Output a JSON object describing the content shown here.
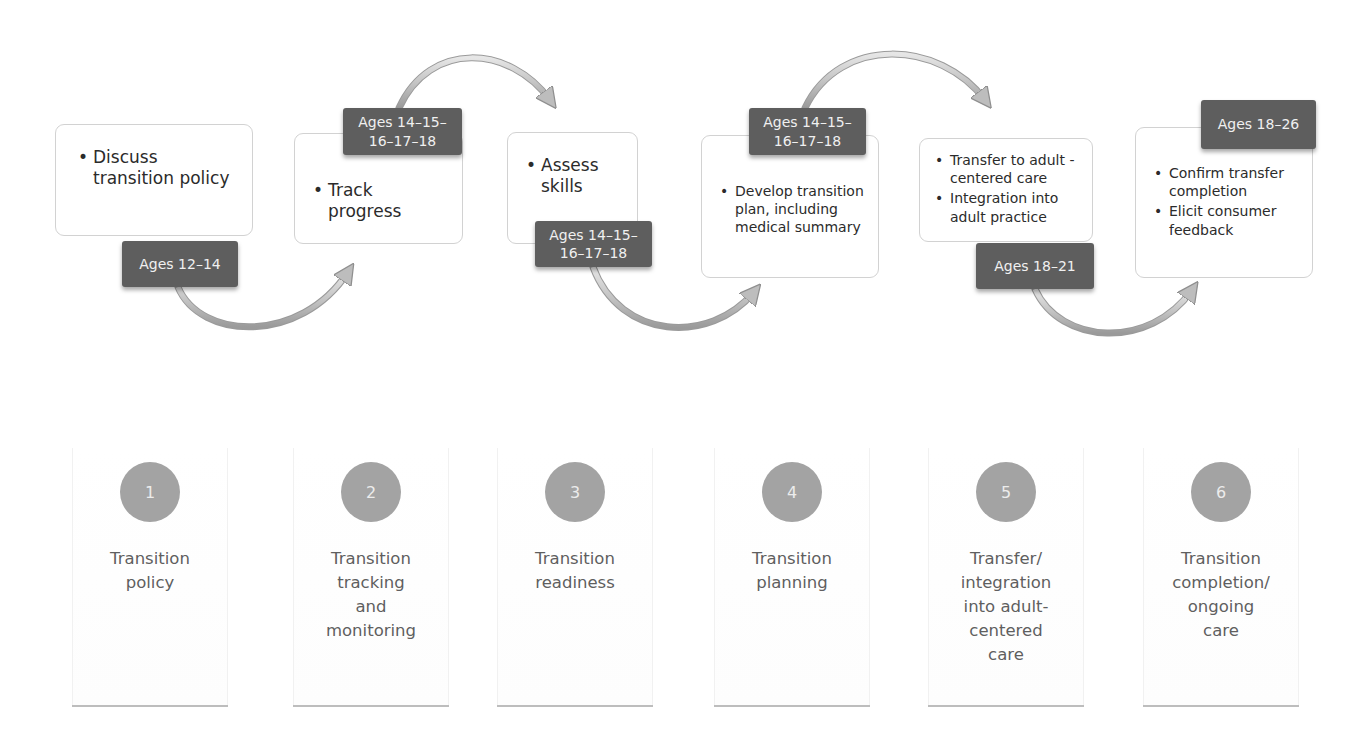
{
  "diagram": {
    "type": "process-flow",
    "steps": [
      {
        "number": "1",
        "label": "Transition\npolicy",
        "age_tag": "Ages 12–14",
        "bullets": [
          "Discuss transition policy"
        ]
      },
      {
        "number": "2",
        "label": "Transition\ntracking\nand\nmonitoring",
        "age_tag": "Ages 14–15–\n16–17–18",
        "bullets": [
          "Track progress"
        ]
      },
      {
        "number": "3",
        "label": "Transition\nreadiness",
        "age_tag": "Ages 14–15–\n16–17–18",
        "bullets": [
          "Assess skills"
        ]
      },
      {
        "number": "4",
        "label": "Transition\nplanning",
        "age_tag": "Ages 14–15–\n16–17–18",
        "bullets": [
          "Develop transition plan, including medical summary"
        ]
      },
      {
        "number": "5",
        "label": "Transfer/\nintegration\ninto adult-\ncentered\ncare",
        "age_tag": "Ages 18–21",
        "bullets": [
          "Transfer to adult -centered care",
          "Integration into adult practice"
        ]
      },
      {
        "number": "6",
        "label": "Transition\ncompletion/\nongoing\ncare",
        "age_tag": "Ages 18–26",
        "bullets": [
          "Confirm transfer completion",
          "Elicit consumer feedback"
        ]
      }
    ],
    "colors": {
      "tag_bg": "#5e5e5e",
      "tag_text": "#f0f0f0",
      "circle_bg": "#a3a3a3",
      "box_border": "#d2d2d2",
      "label_text": "#5f5f5f",
      "arrow": "#c8c8c8"
    }
  }
}
